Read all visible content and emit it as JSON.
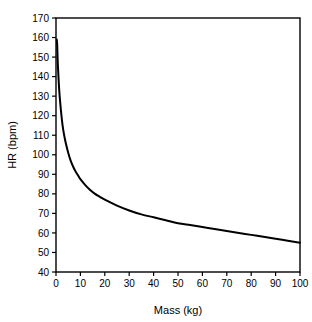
{
  "chart_data": {
    "type": "line",
    "title": "",
    "subtitle": "",
    "xlabel": "Mass (kg)",
    "ylabel": "HR (bpm)",
    "xlim": [
      0,
      100
    ],
    "ylim": [
      40,
      170
    ],
    "xticks": [
      0,
      10,
      20,
      30,
      40,
      50,
      60,
      70,
      80,
      90,
      100
    ],
    "yticks": [
      40,
      50,
      60,
      70,
      80,
      90,
      100,
      110,
      120,
      130,
      140,
      150,
      160,
      170
    ],
    "xtick_labels": [
      "0",
      "10",
      "20",
      "30",
      "40",
      "50",
      "60",
      "70",
      "80",
      "90",
      "100"
    ],
    "ytick_labels": [
      "40",
      "50",
      "60",
      "70",
      "80",
      "90",
      "100",
      "110",
      "120",
      "130",
      "140",
      "150",
      "160",
      "170"
    ],
    "grid": false,
    "legend": null,
    "legend_position": "none",
    "annotations": [],
    "series": [
      {
        "name": "HR vs Mass",
        "color": "#000000",
        "linewidth": 2,
        "x": [
          0.3,
          0.5,
          0.7,
          1.0,
          1.3,
          1.6,
          2.0,
          2.5,
          3.0,
          3.5,
          4.0,
          5.0,
          6.0,
          7.0,
          8.0,
          9.0,
          10.0,
          12.0,
          14.0,
          16.0,
          18.0,
          20.0,
          25.0,
          30.0,
          35.0,
          40.0,
          45.0,
          50.0,
          55.0,
          60.0,
          65.0,
          70.0,
          75.0,
          80.0,
          85.0,
          90.0,
          95.0,
          100.0
        ],
        "y": [
          159.0,
          156.0,
          148.0,
          140.0,
          133.5,
          128.5,
          123.0,
          117.0,
          112.5,
          109.0,
          106.0,
          101.0,
          97.0,
          94.0,
          91.5,
          89.5,
          87.5,
          84.5,
          82.0,
          80.0,
          78.5,
          77.0,
          74.0,
          71.5,
          69.5,
          68.0,
          66.5,
          65.0,
          64.0,
          63.0,
          62.0,
          61.0,
          60.0,
          59.0,
          58.0,
          57.0,
          56.0,
          55.0
        ]
      }
    ]
  },
  "figure": {
    "background_color": "#ffffff",
    "axis_color": "#000000",
    "text_color": "#000000",
    "frame": "box"
  }
}
